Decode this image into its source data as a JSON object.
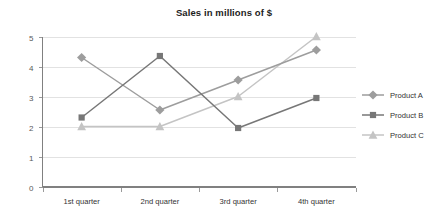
{
  "chart_data": {
    "type": "line",
    "title": "Sales in millions of $",
    "xlabel": "",
    "ylabel": "",
    "ylim": [
      0,
      5
    ],
    "yticks": [
      "0",
      "1",
      "2",
      "3",
      "4",
      "5"
    ],
    "grid": true,
    "legend_position": "right",
    "categories": [
      "1st quarter",
      "2nd quarter",
      "3rd quarter",
      "4th quarter"
    ],
    "series": [
      {
        "name": "Product A",
        "marker": "diamond",
        "color": "#9d9d9d",
        "values": [
          4.3,
          2.55,
          3.55,
          4.55
        ]
      },
      {
        "name": "Product B",
        "marker": "square",
        "color": "#777777",
        "values": [
          2.3,
          4.35,
          1.95,
          2.95
        ]
      },
      {
        "name": "Product C",
        "marker": "triangle",
        "color": "#c4c4c4",
        "values": [
          2.0,
          2.0,
          3.0,
          5.0
        ]
      }
    ]
  },
  "legend": {
    "items": [
      {
        "label": "Product A"
      },
      {
        "label": "Product B"
      },
      {
        "label": "Product C"
      }
    ]
  },
  "colors": {
    "background": "#ffffff",
    "title": "#1d1d1d",
    "gridline": "#e2e2e2",
    "axis": "#808080",
    "tick_text": "#595959",
    "category_text": "#333333"
  }
}
